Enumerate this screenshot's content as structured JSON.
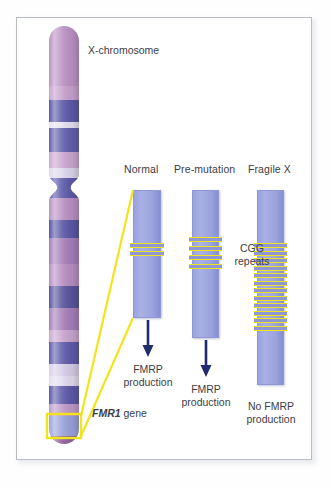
{
  "figure": {
    "background_color": "#ffffff",
    "frame_color": "#b9bcc4"
  },
  "chromosome": {
    "label": "X-chromosome",
    "gene_label_italic": "FMR1",
    "gene_label_rest": " gene",
    "highlight_color": "#f2e41c",
    "band_colors": [
      "#b98fc0",
      "#c49dc9",
      "#5c5aa8",
      "#d8d3ec",
      "#6f6bb4",
      "#b78ec2",
      "#5e5bab",
      "#c79ecb",
      "#6d69b3",
      "#a97fba",
      "#4f4d9e",
      "#b98fc0",
      "#c9a7cf",
      "#6b67b0",
      "#e0d8ee",
      "#8d6fae"
    ]
  },
  "columns": [
    {
      "id": "normal",
      "title": "Normal",
      "repeats": 2,
      "repeat_label": "",
      "outcome_line1": "FMRP",
      "outcome_line2": "production",
      "has_arrow": true
    },
    {
      "id": "pre-mutation",
      "title": "Pre-mutation",
      "repeats": 4,
      "repeat_label_line1": "CGG",
      "repeat_label_line2": "repeats",
      "outcome_line1": "FMRP",
      "outcome_line2": "production",
      "has_arrow": true
    },
    {
      "id": "fragile-x",
      "title": "Fragile X",
      "repeats": 12,
      "repeat_label": "",
      "outcome_line1": "No FMRP",
      "outcome_line2": "production",
      "has_arrow": false
    }
  ],
  "annotations": {
    "cgg_repeats_line1": "CGG",
    "cgg_repeats_line2": "repeats"
  },
  "colors": {
    "gene_bar": "#9aa3dd",
    "repeat_yellow": "#f2e41c",
    "arrow": "#1f2b6e",
    "text": "#3c3c46"
  }
}
